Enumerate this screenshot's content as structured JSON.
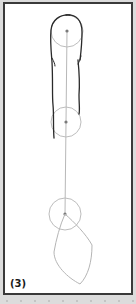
{
  "figure": {
    "label": "(3)",
    "colors": {
      "background": "#dcdcdc",
      "panel": "#ffffff",
      "border": "#3a3a3a",
      "outline_stroke": "#2a2a2a",
      "guide_stroke": "#b0b0b0",
      "joint_dot": "#7a7a7a"
    },
    "joints": [
      {
        "name": "top",
        "cx": 67,
        "cy": 31,
        "r": 16
      },
      {
        "name": "middle",
        "cx": 66,
        "cy": 122,
        "r": 15
      },
      {
        "name": "bottom",
        "cx": 65,
        "cy": 214,
        "r": 16
      }
    ]
  }
}
